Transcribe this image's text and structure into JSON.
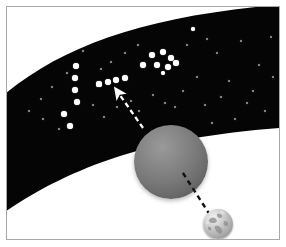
{
  "figure": {
    "title": "Parallax observation diagram",
    "caption": "",
    "background_color": "#ffffff",
    "border_color": "#a8a8a8",
    "width": 286,
    "height": 247
  },
  "sky_band": {
    "name": "distant-star-field-band",
    "fill_color": "#050505",
    "description": "Arched band of deep space containing background stars"
  },
  "constellation": {
    "name": "background-constellation",
    "star_color": "#ffffff",
    "bright_stars": [
      {
        "x": 69,
        "y": 59,
        "r": 3.0
      },
      {
        "x": 68,
        "y": 71,
        "r": 3.0
      },
      {
        "x": 68,
        "y": 83,
        "r": 3.0
      },
      {
        "x": 70,
        "y": 95,
        "r": 3.0
      },
      {
        "x": 57,
        "y": 107,
        "r": 3.0
      },
      {
        "x": 63,
        "y": 119,
        "r": 3.2
      },
      {
        "x": 92,
        "y": 77,
        "r": 2.6
      },
      {
        "x": 101,
        "y": 75,
        "r": 3.0
      },
      {
        "x": 109,
        "y": 73,
        "r": 3.0
      },
      {
        "x": 118,
        "y": 71,
        "r": 3.0
      },
      {
        "x": 136,
        "y": 58,
        "r": 3.0
      },
      {
        "x": 145,
        "y": 48,
        "r": 3.2
      },
      {
        "x": 156,
        "y": 45,
        "r": 3.2
      },
      {
        "x": 164,
        "y": 51,
        "r": 3.0
      },
      {
        "x": 150,
        "y": 58,
        "r": 3.2
      },
      {
        "x": 161,
        "y": 60,
        "r": 3.0
      },
      {
        "x": 169,
        "y": 56,
        "r": 2.8
      },
      {
        "x": 156,
        "y": 66,
        "r": 2.2
      },
      {
        "x": 186,
        "y": 22,
        "r": 2.4
      }
    ],
    "faint_stars": [
      {
        "x": 22,
        "y": 104,
        "r": 1.3
      },
      {
        "x": 34,
        "y": 92,
        "r": 1.1
      },
      {
        "x": 45,
        "y": 80,
        "r": 1.2
      },
      {
        "x": 52,
        "y": 122,
        "r": 1.2
      },
      {
        "x": 86,
        "y": 98,
        "r": 1.3
      },
      {
        "x": 97,
        "y": 110,
        "r": 1.1
      },
      {
        "x": 110,
        "y": 100,
        "r": 1.0
      },
      {
        "x": 124,
        "y": 94,
        "r": 1.2
      },
      {
        "x": 131,
        "y": 38,
        "r": 1.2
      },
      {
        "x": 118,
        "y": 46,
        "r": 1.0
      },
      {
        "x": 104,
        "y": 55,
        "r": 1.1
      },
      {
        "x": 176,
        "y": 84,
        "r": 1.3
      },
      {
        "x": 190,
        "y": 70,
        "r": 1.2
      },
      {
        "x": 198,
        "y": 98,
        "r": 1.2
      },
      {
        "x": 210,
        "y": 46,
        "r": 1.3
      },
      {
        "x": 222,
        "y": 74,
        "r": 1.2
      },
      {
        "x": 234,
        "y": 34,
        "r": 1.1
      },
      {
        "x": 240,
        "y": 96,
        "r": 1.2
      },
      {
        "x": 252,
        "y": 58,
        "r": 1.3
      },
      {
        "x": 258,
        "y": 104,
        "r": 1.1
      },
      {
        "x": 264,
        "y": 30,
        "r": 1.2
      },
      {
        "x": 205,
        "y": 116,
        "r": 1.1
      },
      {
        "x": 228,
        "y": 112,
        "r": 1.0
      },
      {
        "x": 168,
        "y": 100,
        "r": 1.0
      },
      {
        "x": 146,
        "y": 88,
        "r": 1.0
      },
      {
        "x": 76,
        "y": 44,
        "r": 1.0
      },
      {
        "x": 60,
        "y": 66,
        "r": 0.9
      },
      {
        "x": 94,
        "y": 62,
        "r": 0.9
      },
      {
        "x": 180,
        "y": 38,
        "r": 1.0
      },
      {
        "x": 246,
        "y": 84,
        "r": 0.9
      },
      {
        "x": 214,
        "y": 90,
        "r": 0.9
      },
      {
        "x": 36,
        "y": 112,
        "r": 0.9
      },
      {
        "x": 132,
        "y": 104,
        "r": 0.9
      },
      {
        "x": 266,
        "y": 70,
        "r": 1.0
      },
      {
        "x": 200,
        "y": 32,
        "r": 0.9
      },
      {
        "x": 158,
        "y": 96,
        "r": 0.9
      }
    ]
  },
  "planet": {
    "name": "near-object-sphere",
    "label": "",
    "center_x": 164,
    "center_y": 155,
    "radius": 37,
    "fill_light": "#9a9a9a",
    "fill_dark": "#545454"
  },
  "earth": {
    "name": "earth-globe",
    "label": "",
    "center_x": 211,
    "center_y": 217,
    "radius": 15,
    "ocean_color": "#c9c9c9",
    "land_color": "#8d8d8d"
  },
  "sight_line": {
    "name": "observer-sight-line",
    "style": "dashed",
    "color": "#111111",
    "from_x": 203,
    "from_y": 208,
    "to_x": 174,
    "to_y": 163
  },
  "projection_arrow": {
    "name": "apparent-position-arrow",
    "style": "dashed-with-arrowhead",
    "color": "#ffffff",
    "from_x": 136,
    "from_y": 121,
    "to_x": 108,
    "to_y": 81
  },
  "legend": {
    "items": []
  }
}
